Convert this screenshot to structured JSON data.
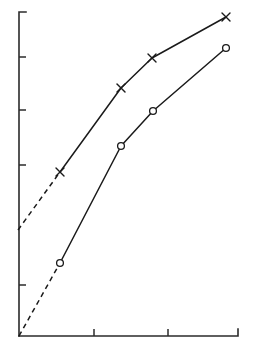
{
  "chart_data": {
    "type": "line",
    "title": "",
    "subtitle": "",
    "xlabel": "",
    "ylabel": "",
    "grid": false,
    "legend": "none",
    "xlim": [
      0,
      5
    ],
    "ylim": [
      0,
      7
    ],
    "x_ticks": [
      0,
      1.5,
      3.0,
      4.5
    ],
    "x_tick_labels": [
      "",
      "",
      "",
      ""
    ],
    "y_ticks": [
      0,
      1.0,
      2.6,
      3.8,
      4.9,
      6.1
    ],
    "y_tick_labels": [
      "",
      "",
      "",
      "",
      "",
      ""
    ],
    "series": [
      {
        "name": "cross-series",
        "marker": "x",
        "line_style_main": "solid",
        "line_style_extrapolation": "dashed",
        "x": [
          0.95,
          1.5,
          2.65,
          3.3,
          4.5
        ],
        "y": [
          2.1,
          3.2,
          5.0,
          5.6,
          6.5
        ],
        "points_marked": [
          false,
          true,
          true,
          true,
          true
        ]
      },
      {
        "name": "circle-series",
        "marker": "o",
        "line_style_main": "solid",
        "line_style_extrapolation": "dashed",
        "x": [
          0.0,
          1.5,
          2.65,
          3.3,
          4.5
        ],
        "y": [
          0.0,
          1.55,
          3.85,
          4.65,
          5.85
        ],
        "points_marked": [
          false,
          true,
          true,
          true,
          true
        ]
      }
    ],
    "annotations": []
  },
  "geometry": {
    "axis": {
      "origin_x": 19,
      "origin_y": 336,
      "top_y": 12,
      "right_x": 238,
      "y_cap_x": 26,
      "x_cap_y": 329
    },
    "y_tick_positions": [
      12,
      57,
      110,
      165,
      285,
      336
    ],
    "x_tick_positions": [
      94,
      168,
      238
    ],
    "tick_length": 7,
    "cross_series_path_solid": "M 60,172 L 121,88 L 152,58 L 226,17",
    "cross_series_path_dashed": "M 18,230 L 60,172",
    "circle_series_path_solid": "M 60,263 L 121,146 L 153,111 L 226,48",
    "circle_series_path_dashed": "M 19,336 L 60,263",
    "cross_markers": [
      {
        "x": 60,
        "y": 172
      },
      {
        "x": 121,
        "y": 88
      },
      {
        "x": 152,
        "y": 58
      },
      {
        "x": 226,
        "y": 17
      }
    ],
    "circle_markers": [
      {
        "x": 60,
        "y": 263
      },
      {
        "x": 121,
        "y": 146
      },
      {
        "x": 153,
        "y": 111
      },
      {
        "x": 226,
        "y": 48
      }
    ],
    "cross_half_size": 4,
    "circle_radius": 3.4
  },
  "colors": {
    "axis": "#2b2b2b",
    "series_line": "#1a1a1a",
    "marker_fill": "#ffffff",
    "background": "#ffffff"
  }
}
